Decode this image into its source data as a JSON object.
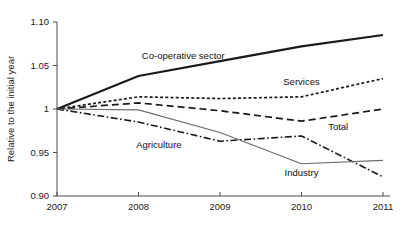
{
  "chart_data": {
    "type": "line",
    "title": "",
    "xlabel": "",
    "ylabel": "Relative to the initial year",
    "x": [
      2007,
      2008,
      2009,
      2010,
      2011
    ],
    "xtick_labels": [
      "2007",
      "2008",
      "2009",
      "2010",
      "2011"
    ],
    "ytick_labels": [
      "1.10",
      "1.05",
      "1",
      "0.95",
      "0.90"
    ],
    "ytick_values": [
      1.1,
      1.05,
      1.0,
      0.95,
      0.9
    ],
    "ylim": [
      0.9,
      1.1
    ],
    "xlim": [
      2007,
      2011
    ],
    "grid": false,
    "legend": "inline-labels",
    "series": [
      {
        "name": "Co-operative sector",
        "style": "solid-thick",
        "color": "#1a1a1a",
        "values": [
          1.0,
          1.038,
          1.055,
          1.072,
          1.085
        ],
        "label_x": 2008.55,
        "label_y": 1.058
      },
      {
        "name": "Services",
        "style": "dotted",
        "color": "#1a1a1a",
        "values": [
          1.0,
          1.014,
          1.012,
          1.014,
          1.035
        ],
        "label_x": 2010.0,
        "label_y": 1.028
      },
      {
        "name": "Total",
        "style": "dashed",
        "color": "#1a1a1a",
        "values": [
          1.0,
          1.007,
          0.998,
          0.986,
          1.0
        ],
        "label_x": 2010.45,
        "label_y": 0.976
      },
      {
        "name": "Agriculture",
        "style": "dash-dot",
        "color": "#1a1a1a",
        "values": [
          1.0,
          0.985,
          0.963,
          0.969,
          0.922
        ],
        "label_x": 2008.25,
        "label_y": 0.9555
      },
      {
        "name": "Industry",
        "style": "solid-thin",
        "color": "#6b6b6b",
        "values": [
          1.0,
          0.999,
          0.973,
          0.937,
          0.941
        ],
        "label_x": 2010.0,
        "label_y": 0.9235
      }
    ]
  },
  "axis": {
    "y_title": "Relative to the initial year"
  }
}
